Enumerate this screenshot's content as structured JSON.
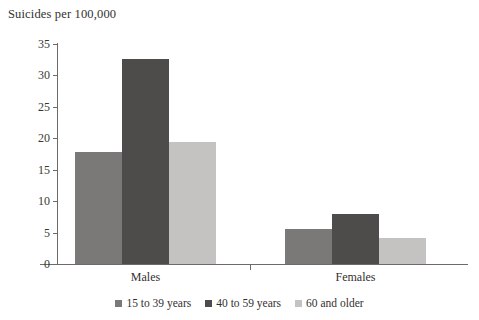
{
  "chart_data": {
    "type": "bar",
    "title": "Suicides per 100,000",
    "xlabel": "",
    "ylabel": "",
    "categories": [
      "Males",
      "Females"
    ],
    "series": [
      {
        "name": "15 to 39 years",
        "color": "#7b7977",
        "values": [
          17.8,
          5.6
        ]
      },
      {
        "name": "40 to 59 years",
        "color": "#4e4c4a",
        "values": [
          32.6,
          8.0
        ]
      },
      {
        "name": "60 and older",
        "color": "#c5c3c1",
        "values": [
          19.4,
          4.2
        ]
      }
    ],
    "ylim": [
      0,
      35
    ],
    "yticks": [
      0,
      5,
      10,
      15,
      20,
      25,
      30,
      35
    ],
    "ytick_labels": [
      "0",
      "5",
      "10",
      "15",
      "20",
      "25",
      "30",
      "35"
    ],
    "grid": false,
    "legend_position": "bottom"
  },
  "axis": {
    "line_color": "#6d6b69"
  }
}
